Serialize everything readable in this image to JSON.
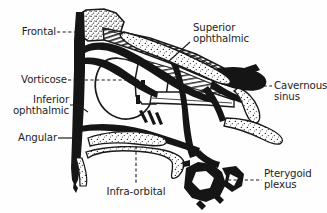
{
  "figure": {
    "background_color": "#fefefe",
    "ink_color": "#1a1a1a",
    "text_color": "#1d1d1d"
  },
  "labels": [
    {
      "id": "frontal",
      "text": "Frontal",
      "leader": "dashed",
      "align": "right",
      "lines": [
        "Frontal"
      ]
    },
    {
      "id": "vorticose",
      "text": "Vorticose",
      "leader": "dashed",
      "align": "right",
      "lines": [
        "Vorticose"
      ]
    },
    {
      "id": "inferior-ophthalmic",
      "text": "Inferior ophthalmic",
      "leader": "solid",
      "align": "right",
      "lines": [
        "Inferior",
        "ophthalmic"
      ]
    },
    {
      "id": "angular",
      "text": "Angular",
      "leader": "solid",
      "align": "right",
      "lines": [
        "Angular"
      ]
    },
    {
      "id": "superior-ophthalmic",
      "text": "Superior ophthalmic",
      "leader": "solid",
      "align": "left",
      "lines": [
        "Superior",
        "ophthalmic"
      ]
    },
    {
      "id": "cavernous-sinus",
      "text": "Cavernous sinus",
      "leader": "dashed",
      "align": "left",
      "lines": [
        "Cavernous",
        "sinus"
      ]
    },
    {
      "id": "pterygoid-plexus",
      "text": "Pterygoid plexus",
      "leader": "dashed",
      "align": "left",
      "lines": [
        "Pterygoid",
        "plexus"
      ]
    },
    {
      "id": "infra-orbital",
      "text": "Infra-orbital",
      "leader": "dashed",
      "align": "center",
      "lines": [
        "Infra-orbital"
      ]
    }
  ],
  "label_text": {
    "frontal": "Frontal",
    "vorticose": "Vorticose",
    "inferior_l1": "Inferior",
    "inferior_l2": "ophthalmic",
    "angular": "Angular",
    "superior_l1": "Superior",
    "superior_l2": "ophthalmic",
    "cavernous_l1": "Cavernous",
    "cavernous_l2": "sinus",
    "pterygoid_l1": "Pterygoid",
    "pterygoid_l2": "plexus",
    "infraorbital": "Infra-orbital"
  },
  "structures": [
    {
      "id": "frontal-sinus",
      "name": "frontal sinus",
      "style": "stippled"
    },
    {
      "id": "angular-vein-trunk",
      "name": "angular vein trunk",
      "style": "solid-dark"
    },
    {
      "id": "superior-ophthalmic-vein",
      "name": "superior ophthalmic vein",
      "style": "solid-dark"
    },
    {
      "id": "orbital-muscle-band",
      "name": "orbital muscle band",
      "style": "hatched"
    },
    {
      "id": "eye-globe",
      "name": "eye globe",
      "style": "outline"
    },
    {
      "id": "optic-nerve",
      "name": "optic nerve",
      "style": "outline"
    },
    {
      "id": "cavernous-sinus-mass",
      "name": "cavernous sinus mass",
      "style": "solid-dark"
    },
    {
      "id": "maxillary-sinus-band",
      "name": "maxillary sinus band",
      "style": "stippled"
    },
    {
      "id": "pterygoid-plexus-mesh",
      "name": "pterygoid plexus mesh",
      "style": "solid-dark-mesh"
    }
  ]
}
